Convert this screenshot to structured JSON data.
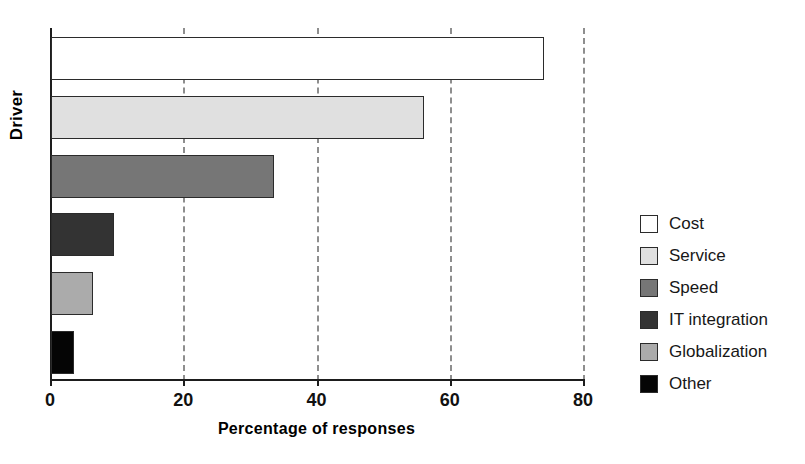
{
  "chart_data": {
    "type": "bar",
    "orientation": "horizontal",
    "title": "",
    "xlabel": "Percentage of responses",
    "ylabel": "Driver",
    "categories": [
      "Cost",
      "Service",
      "Speed",
      "IT integration",
      "Globalization",
      "Other"
    ],
    "values": [
      74,
      56,
      33.5,
      9.5,
      6.3,
      3.5
    ],
    "series": [
      {
        "name": "Percentage of responses",
        "values": [
          74,
          56,
          33.5,
          9.5,
          6.3,
          3.5
        ]
      }
    ],
    "colors": [
      "#ffffff",
      "#e0e0e0",
      "#767676",
      "#333333",
      "#ababab",
      "#050505"
    ],
    "xlim": [
      0,
      80
    ],
    "xticks": [
      0,
      20,
      40,
      60,
      80
    ],
    "xtick_labels": [
      "0",
      "20",
      "40",
      "60",
      "80"
    ],
    "grid": "x-axis dashed vertical gridlines",
    "legend_position": "right",
    "legend_entries": [
      {
        "label": "Cost",
        "color": "#ffffff"
      },
      {
        "label": "Service",
        "color": "#e0e0e0"
      },
      {
        "label": "Speed",
        "color": "#767676"
      },
      {
        "label": "IT integration",
        "color": "#333333"
      },
      {
        "label": "Globalization",
        "color": "#ababab"
      },
      {
        "label": "Other",
        "color": "#050505"
      }
    ]
  },
  "axes": {
    "y_title": "Driver",
    "x_title": "Percentage of responses"
  }
}
